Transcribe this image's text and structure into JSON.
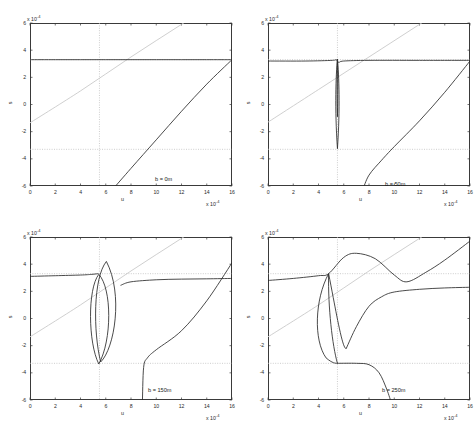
{
  "figure": {
    "panel_count": 4,
    "axis": {
      "xlabel": "u",
      "ylabel": "s",
      "x_exponent": "x 10",
      "x_exponent_sup": "-4",
      "y_exponent": "x 10",
      "y_exponent_sup": "-4",
      "xticks": [
        "0",
        "2",
        "4",
        "6",
        "8",
        "10",
        "12",
        "14",
        "16"
      ],
      "yticks": [
        "6",
        "4",
        "2",
        "0",
        "-2",
        "-4",
        "-6"
      ],
      "xlim": [
        0,
        16
      ],
      "ylim": [
        -6,
        6
      ],
      "grid": "dotted reference lines"
    },
    "colors": {
      "curve": "#2b2b2b",
      "identity_line": "#c9c9c9",
      "reference_dotted": "#b8b8b8",
      "frame": "#3a3a3a",
      "background": "#ffffff"
    },
    "reference": {
      "vertical_u": 5.5,
      "upper_s": 3.3,
      "lower_s": -3.3
    }
  },
  "chart_data": {
    "type": "line",
    "title": "",
    "xlabel": "u",
    "ylabel": "s",
    "xlim": [
      0,
      16
    ],
    "ylim": [
      -6,
      6
    ],
    "x_scale_factor": "1e-4",
    "y_scale_factor": "1e-4",
    "grid": true,
    "legend": "none",
    "panels": [
      {
        "annotation": "b = 0m",
        "b_value": 0,
        "position": "top-left",
        "series": [
          {
            "name": "upper-branch",
            "comment": "flat saturated branch at s = 3.3",
            "x": [
              0,
              2,
              4,
              6,
              8,
              10,
              12,
              14,
              16
            ],
            "y": [
              3.3,
              3.3,
              3.3,
              3.3,
              3.3,
              3.3,
              3.3,
              3.3,
              3.3
            ]
          },
          {
            "name": "lower-rising-branch",
            "comment": "rises from bottom-left at u=6.5 to s=3.3 at u=16",
            "x": [
              6.5,
              8,
              10,
              12,
              14,
              16
            ],
            "y": [
              -6.3,
              -4.7,
              -2.6,
              -0.5,
              1.5,
              3.3
            ]
          },
          {
            "name": "identity-line",
            "comment": "light grey diagonal s = u - 1.3 scaled",
            "x": [
              0,
              4,
              8,
              12,
              16
            ],
            "y": [
              -1.35,
              1.0,
              3.5,
              5.9,
              8.3
            ]
          }
        ]
      },
      {
        "annotation": "b = 50m",
        "b_value": 50,
        "position": "top-right",
        "series": [
          {
            "name": "upper-branch",
            "comment": "flat at s = 3.25 with narrow notch near u = 5.5",
            "x": [
              0,
              3,
              5.1,
              5.4,
              5.6,
              6.0,
              8,
              12,
              16
            ],
            "y": [
              3.2,
              3.2,
              3.25,
              3.3,
              3.1,
              3.2,
              3.25,
              3.25,
              3.25
            ]
          },
          {
            "name": "narrow-loop",
            "comment": "thin vertical loop spanning s = 3.3 down to s = -3.3 at u = 5.5",
            "x_center": 5.5,
            "x_halfwidth": 0.22,
            "y_top": 3.35,
            "y_bottom": -3.25
          },
          {
            "name": "lower-rising-branch",
            "x": [
              7.5,
              8,
              9,
              10,
              12,
              14,
              16
            ],
            "y": [
              -6.3,
              -5.2,
              -4.1,
              -3.1,
              -1.2,
              0.9,
              3.2
            ]
          },
          {
            "name": "identity-line",
            "x": [
              0,
              4,
              8,
              12,
              16
            ],
            "y": [
              -1.3,
              1.1,
              3.5,
              5.9,
              8.3
            ]
          }
        ]
      },
      {
        "annotation": "b = 150m",
        "b_value": 150,
        "position": "bottom-left",
        "series": [
          {
            "name": "upper-branch-left",
            "x": [
              0,
              2,
              4,
              4.9,
              5.4
            ],
            "y": [
              3.1,
              3.15,
              3.2,
              3.25,
              3.3
            ]
          },
          {
            "name": "upper-branch-right",
            "x": [
              7.2,
              8,
              10,
              12,
              14,
              16
            ],
            "y": [
              2.45,
              2.7,
              2.85,
              2.9,
              2.92,
              2.95
            ]
          },
          {
            "name": "wide-tilted-loop",
            "comment": "lens-shaped loop, apex s=4.2 at u=5.9, bottom s=-3.3 at u=5.5",
            "x_left": 4.6,
            "x_right": 7.4,
            "y_top": 4.2,
            "y_bottom": -3.35
          },
          {
            "name": "lower-rising-branch",
            "x": [
              8.9,
              9.0,
              9.3,
              10,
              12,
              14,
              16
            ],
            "y": [
              -6.3,
              -3.6,
              -2.9,
              -2.3,
              -0.9,
              1.3,
              4.1
            ]
          },
          {
            "name": "identity-line",
            "x": [
              0,
              4,
              8,
              12,
              16
            ],
            "y": [
              -1.35,
              1.0,
              3.5,
              5.9,
              8.3
            ]
          }
        ]
      },
      {
        "annotation": "b = 250m",
        "b_value": 250,
        "position": "bottom-right",
        "series": [
          {
            "name": "upper-s-curve",
            "comment": "rises to peak s=4.8 at u=7, dips to s=2.7 at u=11, rises to s=5.7 at u=16",
            "x": [
              0,
              2,
              4,
              4.8,
              6,
              7,
              8.5,
              10,
              11,
              12.5,
              14,
              16
            ],
            "y": [
              2.8,
              2.95,
              3.15,
              3.3,
              4.5,
              4.8,
              4.4,
              3.2,
              2.7,
              3.4,
              4.3,
              5.7
            ]
          },
          {
            "name": "middle-branch",
            "comment": "from loop bottom rising to plateau s=2.3",
            "x": [
              6.2,
              7,
              8,
              9,
              10,
              12,
              14,
              16
            ],
            "y": [
              -2.2,
              -0.6,
              0.9,
              1.6,
              1.95,
              2.15,
              2.25,
              2.3
            ]
          },
          {
            "name": "loop",
            "comment": "loop pinched at s=3.3 (u=4.8) and s=-3.3 (u=5.5)",
            "x_left": 3.6,
            "x_right": 5.6,
            "y_top": 3.3,
            "y_bottom": -3.3
          },
          {
            "name": "lower-falling-branch",
            "x": [
              5.5,
              7,
              8,
              8.8,
              9.4,
              9.8
            ],
            "y": [
              -3.3,
              -3.3,
              -3.4,
              -4.0,
              -5.2,
              -6.3
            ]
          },
          {
            "name": "identity-line",
            "x": [
              0,
              4,
              8,
              12,
              16
            ],
            "y": [
              -1.35,
              1.0,
              3.5,
              5.9,
              8.3
            ]
          }
        ]
      }
    ]
  }
}
